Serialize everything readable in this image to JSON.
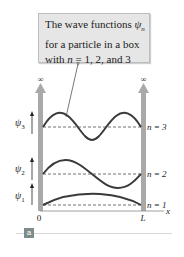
{
  "callout": {
    "line1_prefix": "The wave functions ",
    "line1_symbol": "ψ",
    "line1_sub": "n",
    "line2": "for a particle in a box",
    "line3_prefix": "with ",
    "line3_var": "n",
    "line3_suffix": " = 1, 2, and 3"
  },
  "labels": {
    "infinity_left": "∞",
    "infinity_right": "∞",
    "psi3": "ψ",
    "psi3_sub": "3",
    "psi2": "ψ",
    "psi2_sub": "2",
    "psi1": "ψ",
    "psi1_sub": "1",
    "n3": "n = 3",
    "n2": "n = 2",
    "n1": "n = 1",
    "x_origin": "0",
    "x_end": "L",
    "x_axis": "x"
  },
  "panel_tag": "a",
  "colors": {
    "wall": "#a9a9a9",
    "curve": "#3a3a3a",
    "callout_bg": "#e6e6e6",
    "tag_bg": "#7f8c8c"
  }
}
